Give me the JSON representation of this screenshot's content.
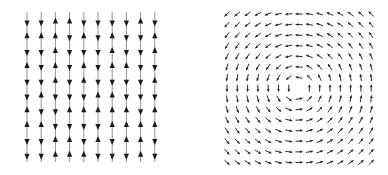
{
  "figure": {
    "panels": [
      {
        "id": "left",
        "description": "Random vertical spin field: columns of up/down arrows",
        "columns": 10,
        "rows": 10,
        "x_start": 27,
        "x_step": 14.2,
        "y_start": 22,
        "y_step": 14.8,
        "line_top": 12,
        "line_bottom": 162,
        "arrow_color": "#1a1a1a",
        "line_color": "#7a7a7a",
        "directions": [
          [
            "d",
            "d",
            "u",
            "u",
            "d",
            "d",
            "d",
            "d",
            "u",
            "d"
          ],
          [
            "u",
            "u",
            "u",
            "d",
            "u",
            "d",
            "u",
            "d",
            "d",
            "u"
          ],
          [
            "d",
            "d",
            "u",
            "d",
            "d",
            "d",
            "u",
            "d",
            "d",
            "u"
          ],
          [
            "u",
            "d",
            "u",
            "d",
            "u",
            "d",
            "u",
            "u",
            "d",
            "d"
          ],
          [
            "d",
            "d",
            "u",
            "d",
            "u",
            "d",
            "d",
            "d",
            "d",
            "u"
          ],
          [
            "d",
            "u",
            "d",
            "d",
            "d",
            "u",
            "u",
            "d",
            "d",
            "d"
          ],
          [
            "u",
            "d",
            "d",
            "u",
            "u",
            "u",
            "u",
            "u",
            "d",
            "u"
          ],
          [
            "u",
            "u",
            "d",
            "d",
            "d",
            "d",
            "u",
            "u",
            "u",
            "u"
          ],
          [
            "d",
            "d",
            "u",
            "u",
            "d",
            "u",
            "d",
            "u",
            "u",
            "d"
          ],
          [
            "d",
            "d",
            "u",
            "u",
            "u",
            "d",
            "d",
            "d",
            "u",
            "d"
          ]
        ]
      },
      {
        "id": "right",
        "description": "Vortex vector field: arrows rotating counter-clockwise around a center",
        "columns": 15,
        "rows": 15,
        "x_start": 227,
        "x_step": 10.3,
        "y_start": 14,
        "y_step": 10.6,
        "center_x": 297,
        "center_y": 88,
        "rotation": "counter-clockwise",
        "arrow_length": 7,
        "arrow_color": "#2a2a2a"
      }
    ]
  }
}
